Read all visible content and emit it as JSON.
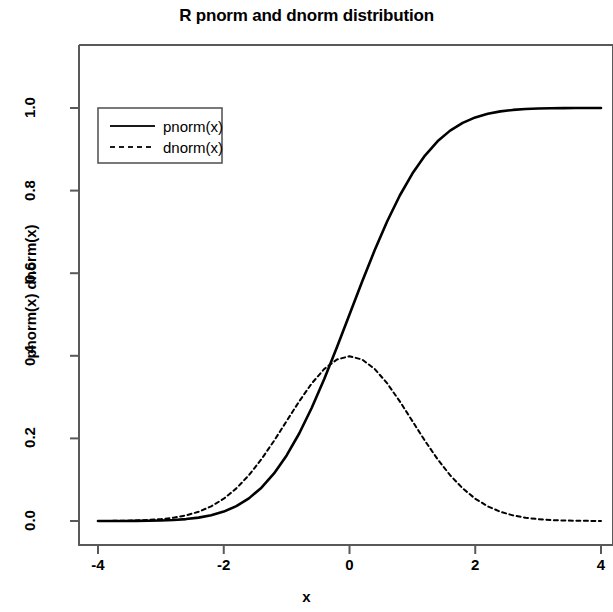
{
  "chart_data": {
    "type": "line",
    "title": "R pnorm and dnorm distribution",
    "xlabel": "x",
    "ylabel": "pnorm(x) dnorm(x)",
    "xlim": [
      -4,
      4
    ],
    "ylim": [
      -0.02,
      1.12
    ],
    "grid": false,
    "legend_position": "top-left",
    "xticks": [
      "-4",
      "-2",
      "0",
      "2",
      "4"
    ],
    "xtick_values": [
      -4,
      -2,
      0,
      2,
      4
    ],
    "yticks": [
      "0.0",
      "0.2",
      "0.4",
      "0.6",
      "0.8",
      "1.0"
    ],
    "ytick_values": [
      0.0,
      0.2,
      0.4,
      0.6,
      0.8,
      1.0
    ],
    "x": [
      -4.0,
      -3.8,
      -3.6,
      -3.4,
      -3.2,
      -3.0,
      -2.8,
      -2.6,
      -2.4,
      -2.2,
      -2.0,
      -1.8,
      -1.6,
      -1.4,
      -1.2,
      -1.0,
      -0.8,
      -0.6,
      -0.4,
      -0.2,
      0.0,
      0.2,
      0.4,
      0.6,
      0.8,
      1.0,
      1.2,
      1.4,
      1.6,
      1.8,
      2.0,
      2.2,
      2.4,
      2.6,
      2.8,
      3.0,
      3.2,
      3.4,
      3.6,
      3.8,
      4.0
    ],
    "series": [
      {
        "name": "pnorm(x)",
        "style": "solid",
        "color": "#000000",
        "values": [
          3e-05,
          7e-05,
          0.00016,
          0.00034,
          0.00069,
          0.00135,
          0.00256,
          0.00466,
          0.0082,
          0.0139,
          0.02275,
          0.03593,
          0.0548,
          0.08076,
          0.11507,
          0.15866,
          0.21186,
          0.27425,
          0.34458,
          0.42074,
          0.5,
          0.57926,
          0.65542,
          0.72575,
          0.78814,
          0.84134,
          0.88493,
          0.91924,
          0.9452,
          0.96407,
          0.97725,
          0.9861,
          0.9918,
          0.99534,
          0.99744,
          0.99865,
          0.99931,
          0.99966,
          0.99984,
          0.99993,
          0.99997
        ]
      },
      {
        "name": "dnorm(x)",
        "style": "dashed",
        "color": "#000000",
        "values": [
          0.00013,
          0.00029,
          0.00061,
          0.00123,
          0.00238,
          0.00443,
          0.00792,
          0.01358,
          0.02239,
          0.03547,
          0.05399,
          0.07895,
          0.11092,
          0.14973,
          0.19419,
          0.24197,
          0.28969,
          0.33322,
          0.36827,
          0.39104,
          0.39894,
          0.39104,
          0.36827,
          0.33322,
          0.28969,
          0.24197,
          0.19419,
          0.14973,
          0.11092,
          0.07895,
          0.05399,
          0.03547,
          0.02239,
          0.01358,
          0.00792,
          0.00443,
          0.00238,
          0.00123,
          0.00061,
          0.00029,
          0.00013
        ]
      }
    ]
  },
  "legend": {
    "entries": [
      {
        "label": "pnorm(x)",
        "style": "solid"
      },
      {
        "label": "dnorm(x)",
        "style": "dashed"
      }
    ]
  },
  "colors": {
    "axis": "#595959",
    "line": "#1a1a1a",
    "background": "#ffffff"
  }
}
